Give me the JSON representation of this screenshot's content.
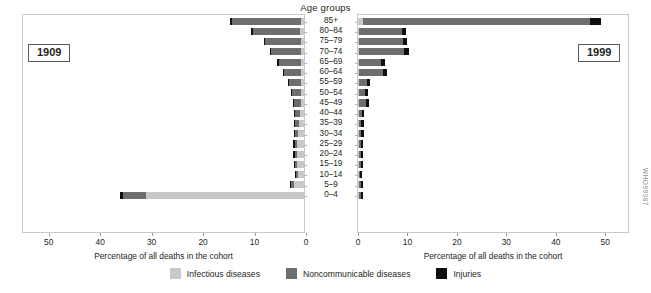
{
  "title": "Age groups",
  "left_panel": {
    "year_label": "1909"
  },
  "right_panel": {
    "year_label": "1999"
  },
  "axis_caption": "Percentage of all deaths in the cohort",
  "source_code": "WHO99387",
  "legend": [
    {
      "key": "infectious",
      "label": "Infectious diseases",
      "color": "#c8c8c6"
    },
    {
      "key": "noncommunicable",
      "label": "Noncommunicable diseases",
      "color": "#6d6e70"
    },
    {
      "key": "injuries",
      "label": "Injuries",
      "color": "#100f0d"
    }
  ],
  "chart_data": {
    "type": "bar",
    "subtype": "paired-horizontal-stacked-pyramid",
    "title": "Age groups",
    "xlabel": "Percentage of all deaths in the cohort",
    "ylabel": "Age groups",
    "grid": false,
    "legend_position": "bottom",
    "categories": [
      "85+",
      "80–84",
      "75–79",
      "70–74",
      "65–69",
      "60–64",
      "55–59",
      "50–54",
      "45–49",
      "40–44",
      "35–39",
      "30–34",
      "25–29",
      "20–24",
      "15–19",
      "10–14",
      "5–9",
      "0–4"
    ],
    "panels": [
      {
        "name": "1909",
        "year": "1909",
        "direction": "left",
        "xlim": [
          0,
          55
        ],
        "xticks": [
          50,
          40,
          30,
          20,
          10,
          0
        ],
        "series": [
          {
            "name": "Infectious diseases",
            "key": "infectious",
            "color": "#c8c8c6",
            "values": [
              0.5,
              0.7,
              0.5,
              0.6,
              0.6,
              0.5,
              0.5,
              0.5,
              0.6,
              0.7,
              0.9,
              1.1,
              1.3,
              1.4,
              1.4,
              1.2,
              2.0,
              30.9
            ]
          },
          {
            "name": "Noncommunicable diseases",
            "key": "noncommunicable",
            "color": "#6d6e70",
            "values": [
              13.6,
              9.3,
              7.1,
              5.9,
              4.2,
              3.4,
              2.4,
              1.9,
              1.4,
              1.0,
              0.8,
              0.6,
              0.5,
              0.4,
              0.3,
              0.3,
              0.5,
              4.5
            ]
          },
          {
            "name": "Injuries",
            "key": "injuries",
            "color": "#100f0d",
            "values": [
              0.3,
              0.3,
              0.2,
              0.2,
              0.4,
              0.2,
              0.2,
              0.2,
              0.2,
              0.2,
              0.2,
              0.2,
              0.3,
              0.3,
              0.3,
              0.2,
              0.3,
              0.6
            ]
          }
        ]
      },
      {
        "name": "1999",
        "year": "1999",
        "direction": "right",
        "xlim": [
          0,
          55
        ],
        "xticks": [
          0,
          10,
          20,
          30,
          40,
          50
        ],
        "series": [
          {
            "name": "Infectious diseases",
            "key": "infectious",
            "color": "#c8c8c6",
            "values": [
              1.1,
              0.3,
              0.3,
              0.3,
              0.2,
              0.2,
              0.2,
              0.2,
              0.2,
              0.1,
              0.1,
              0.1,
              0.1,
              0.1,
              0.1,
              0.1,
              0.2,
              0.3
            ]
          },
          {
            "name": "Noncommunicable diseases",
            "key": "noncommunicable",
            "color": "#6d6e70",
            "values": [
              46.2,
              8.6,
              8.9,
              9.1,
              4.5,
              4.8,
              1.6,
              1.3,
              1.5,
              0.5,
              0.4,
              0.4,
              0.3,
              0.3,
              0.3,
              0.1,
              0.3,
              0.2
            ]
          },
          {
            "name": "Injuries",
            "key": "injuries",
            "color": "#100f0d",
            "values": [
              2.3,
              0.8,
              0.8,
              0.9,
              0.7,
              0.8,
              0.6,
              0.6,
              0.6,
              0.5,
              0.5,
              0.5,
              0.5,
              0.5,
              0.5,
              0.3,
              0.5,
              0.4
            ]
          }
        ]
      }
    ]
  }
}
